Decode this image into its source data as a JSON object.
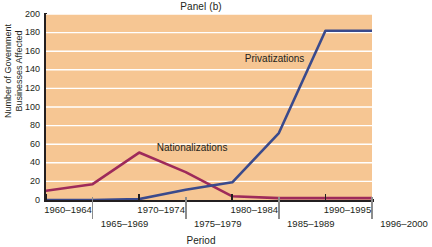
{
  "chart_data": {
    "type": "line",
    "title": "Panel (b)",
    "xlabel": "Period",
    "ylabel": "Number of Government\nBusinesses Affected",
    "categories": [
      "1960–1964",
      "1965–1969",
      "1970–1974",
      "1975–1979",
      "1980–1984",
      "1985–1989",
      "1990–1995",
      "1996–2000"
    ],
    "ylim": [
      0,
      200
    ],
    "yticks": [
      0,
      20,
      40,
      60,
      80,
      100,
      120,
      140,
      160,
      180,
      200
    ],
    "ytick_labels": [
      "0",
      "20",
      "40",
      "60",
      "80",
      "100",
      "120",
      "140",
      "160",
      "180",
      "200"
    ],
    "grid": "horizontal",
    "legend_position": "inline-annotations",
    "series": [
      {
        "name": "Nationalizations",
        "color": "#9e2a5a",
        "values": [
          10,
          17,
          51,
          30,
          4,
          2,
          2,
          2
        ],
        "label_x_pct": 34,
        "label_y_value": 56
      },
      {
        "name": "Privatizations",
        "color": "#3a4a8c",
        "values": [
          0,
          0,
          1,
          11,
          19,
          72,
          182,
          182
        ],
        "label_x_pct": 61,
        "label_y_value": 152
      }
    ],
    "annotations": [
      "Nationalizations",
      "Privatizations"
    ]
  },
  "style": {
    "plot_background": "#f6c693",
    "gridline_color": "#ffffff",
    "axis_color": "#231f20",
    "tick_color": "#8c8c8c",
    "page_background": "#ffffff"
  }
}
